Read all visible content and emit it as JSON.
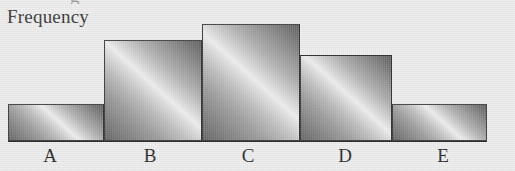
{
  "figure": {
    "background_color": "#ebebeb",
    "bar_border_color": "#20201f",
    "axis_color": "#1a1a1a",
    "clipped_title_tail": "g"
  },
  "axes": {
    "y_axis_label": "Frequency",
    "baseline": {
      "x_start": 8,
      "x_end": 487,
      "y": 140
    }
  },
  "chart_data": {
    "type": "bar",
    "title": "",
    "subtitle": "",
    "xlabel": "",
    "ylabel": "Frequency",
    "categories": [
      "A",
      "B",
      "C",
      "D",
      "E"
    ],
    "values": [
      37,
      101,
      117,
      86,
      37
    ],
    "value_unit": "pixels of bar height",
    "relative_values": [
      3,
      8,
      9,
      7,
      3
    ],
    "ylim": [
      0,
      117
    ],
    "grid": false,
    "legend": false,
    "legend_position": "none",
    "tick_labels_x": [
      "A",
      "B",
      "C",
      "D",
      "E"
    ],
    "tick_labels_y": [],
    "annotations": [],
    "bars": [
      {
        "label": "A",
        "value": 37,
        "relative_value": 3,
        "x": 8,
        "width": 96,
        "top": 104,
        "height": 37,
        "center_x": 56,
        "label_x": 50
      },
      {
        "label": "B",
        "value": 101,
        "relative_value": 8,
        "x": 104,
        "width": 98,
        "top": 40,
        "height": 101,
        "center_x": 153,
        "label_x": 150
      },
      {
        "label": "C",
        "value": 117,
        "relative_value": 9,
        "x": 202,
        "width": 98,
        "top": 24,
        "height": 117,
        "center_x": 251,
        "label_x": 248
      },
      {
        "label": "D",
        "value": 86,
        "relative_value": 7,
        "x": 300,
        "width": 92,
        "top": 55,
        "height": 86,
        "center_x": 346,
        "label_x": 345
      },
      {
        "label": "E",
        "value": 37,
        "relative_value": 3,
        "x": 392,
        "width": 95,
        "top": 104,
        "height": 37,
        "center_x": 439,
        "label_x": 443
      }
    ]
  }
}
